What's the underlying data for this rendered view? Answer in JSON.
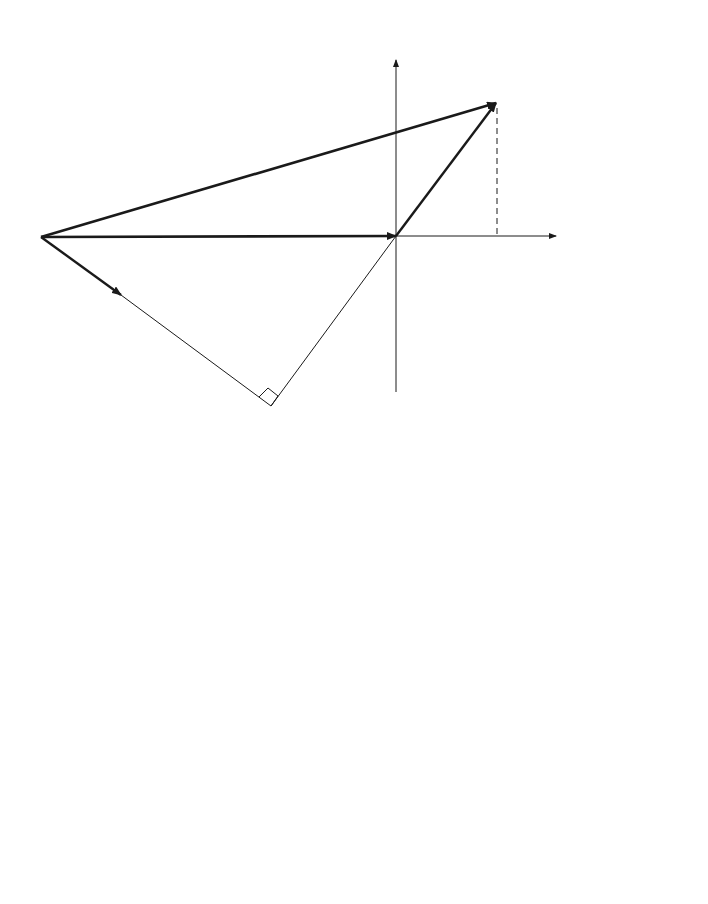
{
  "diagram_a": {
    "caption": "(a)",
    "vertical_axis_label": "Volts",
    "horizontal_axis_label": "Volts",
    "origin_label": "0",
    "point_a_label": "A",
    "point_b_label": "B",
    "ea_label_main": "E",
    "ea_label_sub": "A",
    "vphi_label_main": "V",
    "vphi_label_sub": "φ",
    "ia_label_main": "I",
    "ia_label_sub": "A",
    "jxs_label": "jX",
    "jxs_sub": "S",
    "jxs_ia": "I",
    "jxs_ia_sub": "A",
    "theta_left": "θ",
    "theta_right": "θ"
  },
  "diagram_b": {
    "caption": "(b)",
    "vertical_axis_label": "kW",
    "horizontal_axis_label": "kVAR",
    "origin_label": "0",
    "point_a_label": "A",
    "point_b_label": "B",
    "theta_left": "θ",
    "theta_right": "θ",
    "de_label": "D",
    "de_sub": "E",
    "de_eq": " = ",
    "de_num": "3E",
    "de_num_sub": "A",
    "de_num_v": "V",
    "de_num_v_sub": "φ",
    "de_den": "X",
    "de_den_sub": "S",
    "s_label": "S = 3V",
    "s_sub": "φ",
    "s_ia": " I",
    "s_ia_sub": "A",
    "p_label": "P = 3V",
    "p_sub": "φ",
    "p_ia": " I",
    "p_ia_sub": "A",
    "p_tail": " cos θ",
    "q_label": "Q = 3V",
    "q_sub": "φ",
    "q_ia": " I",
    "q_ia_sub": "A",
    "q_tail": " sin θ",
    "bottom_num": "3V",
    "bottom_num_sub": "φ",
    "bottom_num_sup": "2",
    "bottom_den": "X",
    "bottom_den_sub": "S"
  }
}
